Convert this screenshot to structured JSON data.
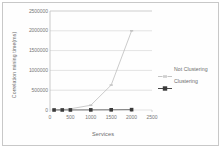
{
  "figure": {
    "background": "#ffffff",
    "border_color": "#c8c8c8"
  },
  "chart_data": {
    "type": "line",
    "title": "",
    "xlabel": "Services",
    "ylabel": "Correlation mining time(ms)",
    "xlim": [
      0,
      2500
    ],
    "ylim": [
      0,
      2500000
    ],
    "xticks": [
      0,
      500,
      1000,
      1500,
      2000,
      2500
    ],
    "xtick_labels": [
      "0",
      "500",
      "1000",
      "1500",
      "2000",
      "2500"
    ],
    "yticks": [
      0,
      500000,
      1000000,
      1500000,
      2000000,
      2500000
    ],
    "ytick_labels": [
      "0",
      "500000",
      "1000000",
      "1500000",
      "2000000",
      "2500000"
    ],
    "grid": "horizontal",
    "legend_position": "right",
    "x": [
      100,
      300,
      500,
      1000,
      1500,
      2000
    ],
    "series": [
      {
        "name": "Not Clustering",
        "color": "#b9b9b9",
        "marker": "dash",
        "marker_color": "#c4c4c4",
        "values": [
          2000,
          12000,
          30000,
          120000,
          630000,
          2000000
        ]
      },
      {
        "name": "Clustering",
        "color": "#4a4a4a",
        "marker": "square",
        "marker_color": "#3a3a3a",
        "values": [
          500,
          900,
          1500,
          3000,
          5000,
          9000
        ]
      }
    ]
  },
  "legend": {
    "items": [
      {
        "label": "Not Clustering"
      },
      {
        "label": "Clustering"
      }
    ]
  }
}
